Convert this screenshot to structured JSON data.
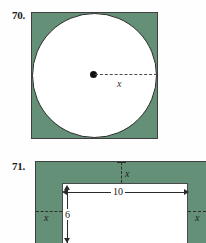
{
  "page": {
    "background_color": "#fefefe",
    "shaded_color": "#639076",
    "outline_color": "#3f3f3f",
    "figure_fill": "#ffffff"
  },
  "problems": [
    {
      "number": "70.",
      "figure_type": "circle-inscribed-in-square",
      "labels": {
        "radius": "x"
      },
      "shaded_region": "square-minus-circle",
      "description_elements": {
        "center_dot": true,
        "radius_line_style": "dashed"
      }
    },
    {
      "number": "71.",
      "figure_type": "rectangle-with-uniform-border",
      "labels": {
        "border_top": "x",
        "border_left": "x",
        "border_right": "x",
        "width": "10",
        "height": "6"
      },
      "shaded_region": "border-frame",
      "description_elements": {
        "border_line_style": "dashed",
        "dimension_line_style": "double-arrow"
      }
    }
  ]
}
